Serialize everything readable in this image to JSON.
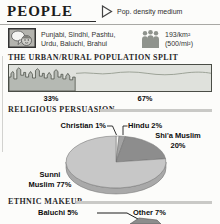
{
  "header": {
    "title": "PEOPLE",
    "pop_density": "Pop. density medium"
  },
  "languages": {
    "line1": "Punjabi, Sindhi, Pashtu,",
    "line2": "Urdu, Baluchi, Brahui"
  },
  "density": {
    "metric": "193/km²",
    "imperial": "(500/mi²)"
  },
  "urban_rural": {
    "heading": "THE URBAN/RURAL POPULATION SPLIT",
    "urban_label": "33%",
    "rural_label": "67%"
  },
  "religion": {
    "heading": "RELIGIOUS PERSUASION",
    "labels": {
      "christian": "Christian 1%",
      "hindu": "Hindu 2%",
      "shia_line1": "Shi'a Muslim",
      "shia_line2": "20%",
      "sunni_line1": "Sunni",
      "sunni_line2": "Muslim 77%"
    }
  },
  "ethnic": {
    "heading": "ETHNIC MAKEUP",
    "labels": {
      "baluchi": "Baluchi 5%",
      "other": "Other 7%"
    }
  },
  "icons": {
    "pop_density_marker": "triangle-right-outline",
    "languages": "speech-bubble-and-face",
    "population_density": "crowd-of-people"
  },
  "colors": {
    "page_bg": "#fcfcfa",
    "rule_dark": "#2a2a2a",
    "rule_light": "#c9c9c6",
    "bar_sky": "#dfe1dc",
    "bar_urban_fill": "#b5b9b3",
    "bar_outline": "#4a4d46",
    "bar_rural_line": "#9aa094",
    "pie_rim": "#a9a9a9",
    "pie_stroke": "#6f6f6f",
    "icon_gray": "#8f938d"
  },
  "chart_data": [
    {
      "type": "bar",
      "title": "THE URBAN/RURAL POPULATION SPLIT",
      "categories": [
        "Urban",
        "Rural"
      ],
      "values": [
        33,
        67
      ],
      "unit": "%"
    },
    {
      "type": "pie",
      "title": "RELIGIOUS PERSUASION",
      "slices": [
        {
          "label": "Christian",
          "value": 1,
          "color": "#f2f2f0"
        },
        {
          "label": "Hindu",
          "value": 2,
          "color": "#a3a3a3"
        },
        {
          "label": "Shi'a Muslim",
          "value": 20,
          "color": "#8d8d8d"
        },
        {
          "label": "Sunni Muslim",
          "value": 77,
          "color": "#c7c7c7"
        }
      ]
    },
    {
      "type": "pie",
      "title": "ETHNIC MAKEUP",
      "slices": [
        {
          "label": "Baluchi",
          "value": 5,
          "color": "#8d8d8d"
        },
        {
          "label": "Other",
          "value": 7,
          "color": "#8d8d8d"
        }
      ]
    }
  ]
}
